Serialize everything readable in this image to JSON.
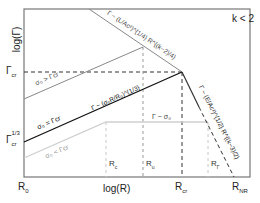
{
  "figure": {
    "annotation": "k < 2",
    "axes": {
      "ylabel": "log(Γ)",
      "xlabel": "log(R)"
    },
    "y_ticks": [
      {
        "base": "Γ",
        "sub": "cr",
        "sup": ""
      },
      {
        "base": "Γ",
        "sub": "cr",
        "sup": "1/3"
      }
    ],
    "x_ticks": [
      {
        "base": "R",
        "sub": "0"
      },
      {
        "base": "R",
        "sub": "cr"
      },
      {
        "base": "R",
        "sub": "NR"
      }
    ],
    "inner_markers": [
      {
        "base": "R",
        "sub": "c"
      },
      {
        "base": "R",
        "sub": "u"
      },
      {
        "base": "R",
        "sub": "Γ"
      }
    ],
    "curves": [
      {
        "id": "sigma-greater",
        "label": "σ₀ > Γcr",
        "color": "#888888"
      },
      {
        "id": "sigma-equal",
        "label": "σ₀ = Γcr",
        "color": "#111111"
      },
      {
        "id": "sigma-less",
        "label": "σ₀ < Γcr",
        "color": "#c8c8c8"
      }
    ],
    "relations": {
      "top_decay": "Γ ~ (L/Ac²)^{1/4} R^{(k−2)/4}",
      "black_rise": "Γ ~ (σ₀R/R₀)^{1/3}",
      "plateau": "Γ ~ σ₀",
      "nonrel_decay": "Γ ~ (E/Ac²)^{1/2} R^{(k−3)/2}"
    }
  }
}
